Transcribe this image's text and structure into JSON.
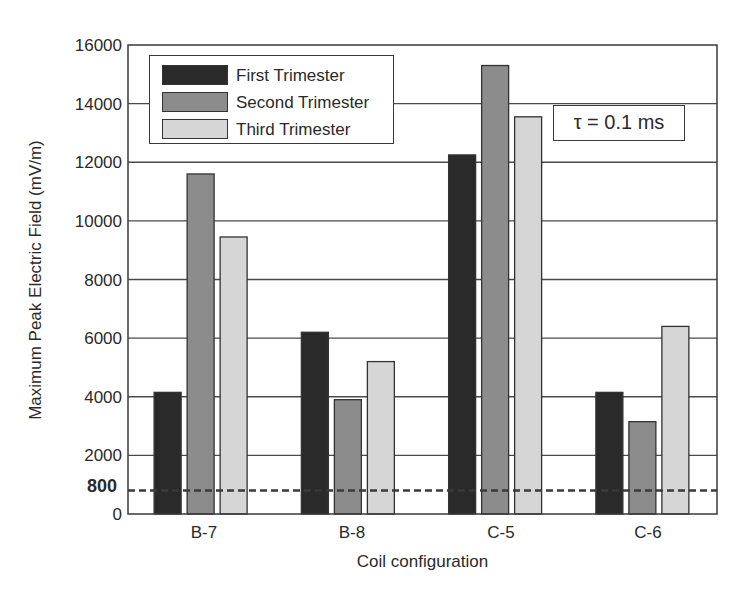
{
  "chart_data": {
    "type": "bar",
    "title": "",
    "xlabel": "Coil configuration",
    "ylabel": "Maximum Peak Electric Field (mV/m)",
    "ylim": [
      0,
      16000
    ],
    "yticks": [
      0,
      2000,
      4000,
      6000,
      8000,
      10000,
      12000,
      14000,
      16000
    ],
    "extra_ytick": {
      "value": 800,
      "label": "800",
      "bold": true
    },
    "grid": true,
    "legend_position": "upper left",
    "categories": [
      "B-7",
      "B-8",
      "C-5",
      "C-6"
    ],
    "series": [
      {
        "name": "First Trimester",
        "color": "#2a2a2a",
        "values": [
          4150,
          6200,
          12250,
          4150
        ]
      },
      {
        "name": "Second Trimester",
        "color": "#8c8c8c",
        "values": [
          11600,
          3900,
          15300,
          3150
        ]
      },
      {
        "name": "Third Trimester",
        "color": "#d6d6d6",
        "values": [
          9450,
          5200,
          13550,
          6400
        ]
      }
    ],
    "reference_line": {
      "value": 800,
      "style": "dashed",
      "color": "#3a3a3a"
    },
    "annotations": [
      "τ = 0.1 ms"
    ]
  },
  "legend": {
    "items": [
      "First Trimester",
      "Second Trimester",
      "Third Trimester"
    ]
  },
  "annotation_text": "τ = 0.1 ms",
  "axis": {
    "xlabel": "Coil configuration",
    "ylabel": "Maximum Peak Electric Field (mV/m)",
    "ytick_labels": [
      "0",
      "2000",
      "4000",
      "6000",
      "8000",
      "10000",
      "12000",
      "14000",
      "16000"
    ],
    "threshold_label": "800",
    "categories": [
      "B-7",
      "B-8",
      "C-5",
      "C-6"
    ]
  }
}
